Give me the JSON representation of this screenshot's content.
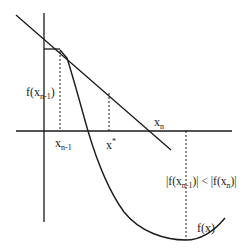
{
  "diagram": {
    "type": "secant-method-illustration",
    "colors": {
      "line": "#1a1a1a",
      "background": "#ffffff"
    },
    "labels": {
      "f_xn_minus_1": {
        "base": "f(x",
        "sub": "n-1",
        "close": ")"
      },
      "x_n_minus_1": {
        "base": "x",
        "sub": "n-1"
      },
      "x_star": {
        "base": "x",
        "sup": "*"
      },
      "x_n": {
        "base": "x",
        "sub": "n"
      },
      "inequality": {
        "left_open": "|f(x",
        "left_sub": "n-1",
        "left_close": ")|",
        "op": " < ",
        "right_open": "|f(x",
        "right_sub": "n",
        "right_close": ")|"
      },
      "fx": "f(x)"
    }
  }
}
